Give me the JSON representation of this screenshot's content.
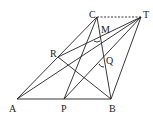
{
  "diagram": {
    "type": "geometry",
    "points": {
      "A": {
        "label": "A",
        "x": 17,
        "y": 99
      },
      "P": {
        "label": "P",
        "x": 64,
        "y": 99
      },
      "B": {
        "label": "B",
        "x": 111,
        "y": 99
      },
      "C": {
        "label": "C",
        "x": 97,
        "y": 17
      },
      "T": {
        "label": "T",
        "x": 141,
        "y": 17
      },
      "R": {
        "label": "R",
        "x": 58,
        "y": 57
      },
      "M": {
        "label": "M",
        "x": 101,
        "y": 32
      },
      "Q": {
        "label": "Q",
        "x": 104,
        "y": 60
      }
    },
    "segments": [
      [
        "A",
        "B"
      ],
      [
        "A",
        "C"
      ],
      [
        "C",
        "B"
      ],
      [
        "B",
        "T"
      ],
      [
        "C",
        "P"
      ],
      [
        "A",
        "T"
      ],
      [
        "R",
        "T"
      ],
      [
        "R",
        "B"
      ],
      [
        "P",
        "T"
      ],
      [
        "A",
        "Q"
      ]
    ],
    "dashed_segments": [
      [
        "C",
        "T"
      ]
    ],
    "angle_marks": [
      "M",
      "Q"
    ]
  }
}
